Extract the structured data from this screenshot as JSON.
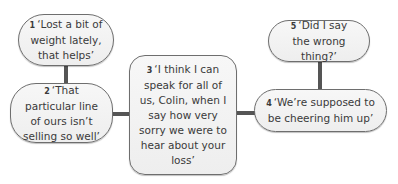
{
  "diagram": {
    "nodes": [
      {
        "number": "1",
        "text": "‘Lost a bit of weight lately, that helps’"
      },
      {
        "number": "2",
        "text": "‘That particular line of ours isn’t selling so well’"
      },
      {
        "number": "3",
        "text": "‘I think I can speak for all of us, Colin, when I say how very sorry we were to hear about your loss’"
      },
      {
        "number": "4",
        "text": "‘We’re supposed to be cheering him up’"
      },
      {
        "number": "5",
        "text": "‘Did I say the wrong thing?’"
      }
    ],
    "connections": [
      {
        "from": "1",
        "to": "2"
      },
      {
        "from": "2",
        "to": "3"
      },
      {
        "from": "3",
        "to": "4"
      },
      {
        "from": "5",
        "to": "4"
      }
    ],
    "colors": {
      "node_fill": "#f2f2f2",
      "node_border": "#6e6e6e",
      "connector": "#555555",
      "text": "#3a3a3a"
    }
  }
}
